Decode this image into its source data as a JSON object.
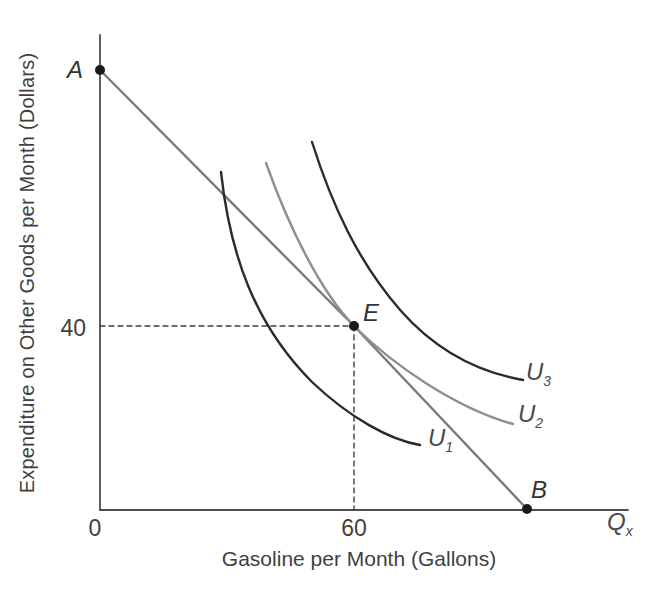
{
  "figure": {
    "width": 660,
    "height": 592,
    "background": "#ffffff"
  },
  "chart_data": {
    "type": "line",
    "title": "",
    "xlabel": "Gasoline per Month (Gallons)",
    "ylabel": "Expenditure on Other Goods per Month (Dollars)",
    "x_axis_end_label": {
      "base": "Q",
      "sub": "x"
    },
    "x_ticks": [
      {
        "value": 0,
        "label": "0"
      },
      {
        "value": 60,
        "label": "60"
      }
    ],
    "y_ticks": [
      {
        "value": 40,
        "label": "40"
      }
    ],
    "key_points": [
      {
        "label": "A",
        "x": 0,
        "y": 93,
        "description": "budget-line intercept on the expenditure (y) axis"
      },
      {
        "label": "E",
        "x": 60,
        "y": 40,
        "description": "consumer optimum: tangency of budget line AB with indifference curve U2"
      },
      {
        "label": "B",
        "x": 101,
        "y": 0,
        "description": "budget-line intercept on the gasoline (x) axis"
      }
    ],
    "dashed_guides": [
      {
        "from": "y-axis at 40",
        "to": "point E"
      },
      {
        "from": "point E",
        "to": "x-axis at 60"
      }
    ],
    "series": [
      {
        "name": "budget line AB",
        "kind": "straight-line",
        "color": "#7b7b7b",
        "label": null
      },
      {
        "name": "U1",
        "kind": "indifference-curve",
        "color": "#2b2b2b",
        "label": {
          "base": "U",
          "sub": "1"
        }
      },
      {
        "name": "U2",
        "kind": "indifference-curve",
        "color": "#8f8f8f",
        "label": {
          "base": "U",
          "sub": "2"
        },
        "note": "tangent to budget line at E"
      },
      {
        "name": "U3",
        "kind": "indifference-curve",
        "color": "#2b2b2b",
        "label": {
          "base": "U",
          "sub": "3"
        }
      }
    ],
    "axis_color": "#4d4d4d",
    "grid": false,
    "legend": "none"
  },
  "geometry": {
    "paths": [
      {
        "name": "y-axis",
        "d": "M100,35 L100,510",
        "stroke": "#4d4d4d",
        "width": 1.8
      },
      {
        "name": "x-axis",
        "d": "M100,510 L628,510",
        "stroke": "#4d4d4d",
        "width": 1.8
      },
      {
        "name": "dashed-guide-y40",
        "d": "M100,326 L354,326",
        "stroke": "#3f3f3f",
        "width": 1.4,
        "dash": "5 4"
      },
      {
        "name": "dashed-guide-x60",
        "d": "M354,326 L354,510",
        "stroke": "#3f3f3f",
        "width": 1.4,
        "dash": "5 4"
      },
      {
        "name": "budget-line-ab",
        "d": "M100,70 L354,326 L527,509",
        "stroke": "#7b7b7b",
        "width": 2.4
      },
      {
        "name": "curve-u1",
        "d": "M221,172 C230,255 255,325 312,382 C350,418 390,440 420,445",
        "stroke": "#2b2b2b",
        "width": 2.4
      },
      {
        "name": "curve-u2",
        "d": "M266,163 C288,225 320,291 354,326 C392,364 455,408 513,424",
        "stroke": "#8f8f8f",
        "width": 2.4
      },
      {
        "name": "curve-u3",
        "d": "M312,142 C332,205 358,262 401,311 C440,355 483,373 523,380",
        "stroke": "#2b2b2b",
        "width": 2.4
      }
    ],
    "dots": [
      {
        "name": "dot-a",
        "cx": 100,
        "cy": 70,
        "r": 5,
        "fill": "#1a1a1a"
      },
      {
        "name": "dot-e",
        "cx": 354,
        "cy": 326,
        "r": 5,
        "fill": "#1a1a1a"
      },
      {
        "name": "dot-b",
        "cx": 527,
        "cy": 509,
        "r": 5,
        "fill": "#1a1a1a"
      }
    ]
  }
}
